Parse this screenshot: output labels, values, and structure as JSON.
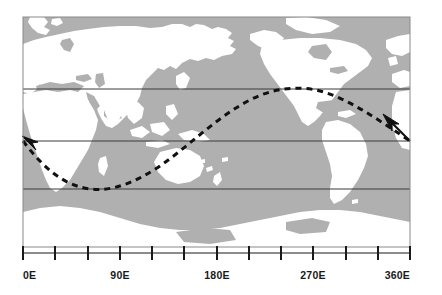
{
  "figure": {
    "type": "map-diagram",
    "colors": {
      "ocean": "#b0b0b0",
      "land": "#ffffff",
      "gridline": "#3a3a3a",
      "axis": "#1a1a1a",
      "wave": "#111111",
      "arrow": "#111111",
      "background": "#ffffff"
    }
  },
  "map": {
    "frame": {
      "x": 23,
      "y": 17,
      "width": 387,
      "height": 230
    },
    "projection": "equirectangular",
    "lon_range": [
      0,
      360
    ],
    "lat_range": [
      90,
      -90
    ]
  },
  "gridlines": {
    "label": "horizontal latitude lines",
    "y_positions": [
      89,
      141,
      189
    ],
    "count": 3
  },
  "wave": {
    "label": "dashed sinusoidal path",
    "style": "dashed",
    "dash": "6 5",
    "stroke_width": 3,
    "trough_y": 189,
    "peak_y": 89,
    "trough_x": 122,
    "peak_x": 305,
    "start_x": 23,
    "end_x": 410,
    "start_y": 141,
    "end_y": 141
  },
  "arrows": [
    {
      "name": "left-arrowhead",
      "x": 25,
      "y": 139,
      "direction": "up-left"
    },
    {
      "name": "right-arrowhead",
      "x": 386,
      "y": 118,
      "direction": "up-left"
    }
  ],
  "axis": {
    "name": "longitude-axis",
    "y": 253,
    "x_start": 23,
    "x_end": 410,
    "tick_interval_deg": 30,
    "ticks": [
      {
        "deg": 0,
        "x": 23,
        "label": "0E",
        "labeled": true
      },
      {
        "deg": 30,
        "x": 55,
        "label": "",
        "labeled": false
      },
      {
        "deg": 60,
        "x": 88,
        "label": "",
        "labeled": false
      },
      {
        "deg": 90,
        "x": 120,
        "label": "90E",
        "labeled": true
      },
      {
        "deg": 120,
        "x": 152,
        "label": "",
        "labeled": false
      },
      {
        "deg": 150,
        "x": 184,
        "label": "",
        "labeled": false
      },
      {
        "deg": 180,
        "x": 217,
        "label": "180E",
        "labeled": true
      },
      {
        "deg": 210,
        "x": 249,
        "label": "",
        "labeled": false
      },
      {
        "deg": 240,
        "x": 281,
        "label": "",
        "labeled": false
      },
      {
        "deg": 270,
        "x": 313,
        "label": "270E",
        "labeled": true
      },
      {
        "deg": 300,
        "x": 346,
        "label": "",
        "labeled": false
      },
      {
        "deg": 330,
        "x": 378,
        "label": "",
        "labeled": false
      },
      {
        "deg": 360,
        "x": 410,
        "label": "360E",
        "labeled": true
      }
    ],
    "labels": [
      "0E",
      "90E",
      "180E",
      "270E",
      "360E"
    ]
  }
}
